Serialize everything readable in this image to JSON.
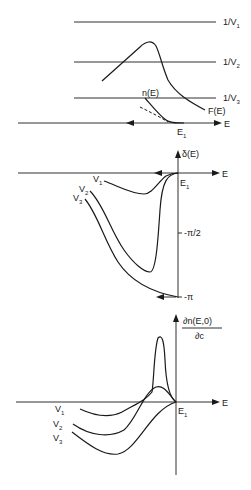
{
  "panels": {
    "top": {
      "lines": [
        {
          "label": "1/V",
          "sub": "1"
        },
        {
          "label": "1/V",
          "sub": "2"
        },
        {
          "label": "1/V",
          "sub": "3"
        }
      ],
      "curve_labels": {
        "nE": "n(E)",
        "FE": "F(E)"
      },
      "axis_label": "E",
      "edge_label": "E",
      "edge_sub": "1"
    },
    "middle": {
      "y_axis_label": "δ(E)",
      "axis_label": "E",
      "edge_label": "E",
      "edge_sub": "1",
      "ticks": [
        "-π/2",
        "-π"
      ],
      "curves": [
        {
          "label": "V",
          "sub": "1"
        },
        {
          "label": "V",
          "sub": "2"
        },
        {
          "label": "V",
          "sub": "3"
        }
      ]
    },
    "bottom": {
      "y_axis_numerator": "∂n(E,0)",
      "y_axis_denominator": "∂c",
      "axis_label": "E",
      "edge_label": "E",
      "edge_sub": "1",
      "curves": [
        {
          "label": "V",
          "sub": "1"
        },
        {
          "label": "V",
          "sub": "2"
        },
        {
          "label": "V",
          "sub": "3"
        }
      ]
    }
  },
  "colors": {
    "ink": "#1a1a1a",
    "background": "#ffffff"
  }
}
